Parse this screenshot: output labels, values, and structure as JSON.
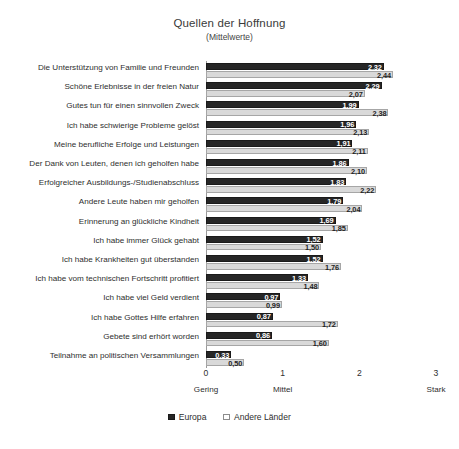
{
  "chart_data": {
    "type": "bar",
    "orientation": "horizontal",
    "title": "Quellen der Hoffnung",
    "subtitle": "(Mittelwerte)",
    "xlabel": "",
    "ylabel": "",
    "xlim": [
      0,
      3
    ],
    "xticks": [
      0,
      1,
      2,
      3
    ],
    "xtick_labels": [
      "0",
      "1",
      "2",
      "3"
    ],
    "xtick_anchor_labels": [
      "Gering",
      "Mittel",
      "",
      "Stark"
    ],
    "grid": false,
    "legend_position": "bottom",
    "value_label_format": "comma-decimal",
    "categories": [
      "Die Unterstützung von Familie und Freunden",
      "Schöne Erlebnisse in der freien Natur",
      "Gutes tun für einen sinnvollen Zweck",
      "Ich habe schwierige Probleme gelöst",
      "Meine berufliche Erfolge und Leistungen",
      "Der Dank von Leuten, denen ich geholfen habe",
      "Erfolgreicher Ausbildungs-/Studienabschluss",
      "Andere Leute haben mir geholfen",
      "Erinnerung an glückliche Kindheit",
      "Ich habe immer Glück gehabt",
      "Ich habe Krankheiten gut überstanden",
      "Ich habe vom technischen Fortschritt profitiert",
      "Ich habe viel Geld verdient",
      "Ich habe Gottes Hilfe erfahren",
      "Gebete sind erhört worden",
      "Teilnahme an politischen Versammlungen"
    ],
    "series": [
      {
        "name": "Europa",
        "color": "#262626",
        "values": [
          2.32,
          2.29,
          1.99,
          1.96,
          1.91,
          1.86,
          1.83,
          1.79,
          1.69,
          1.52,
          1.52,
          1.33,
          0.97,
          0.87,
          0.86,
          0.33
        ],
        "value_labels": [
          "2,32",
          "2,29",
          "1,99",
          "1,96",
          "1,91",
          "1,86",
          "1,83",
          "1,79",
          "1,69",
          "1,52",
          "1,52",
          "1,33",
          "0,97",
          "0,87",
          "0,86",
          "0,33"
        ]
      },
      {
        "name": "Andere Länder",
        "color": "#d9d9d9",
        "values": [
          2.44,
          2.07,
          2.38,
          2.13,
          2.11,
          2.1,
          2.22,
          2.04,
          1.85,
          1.5,
          1.76,
          1.48,
          0.99,
          1.72,
          1.6,
          0.5
        ],
        "value_labels": [
          "2,44",
          "2,07",
          "2,38",
          "2,13",
          "2,11",
          "2,10",
          "2,22",
          "2,04",
          "1,85",
          "1,50",
          "1,76",
          "1,48",
          "0,99",
          "1,72",
          "1,60",
          "0,50"
        ]
      }
    ]
  }
}
